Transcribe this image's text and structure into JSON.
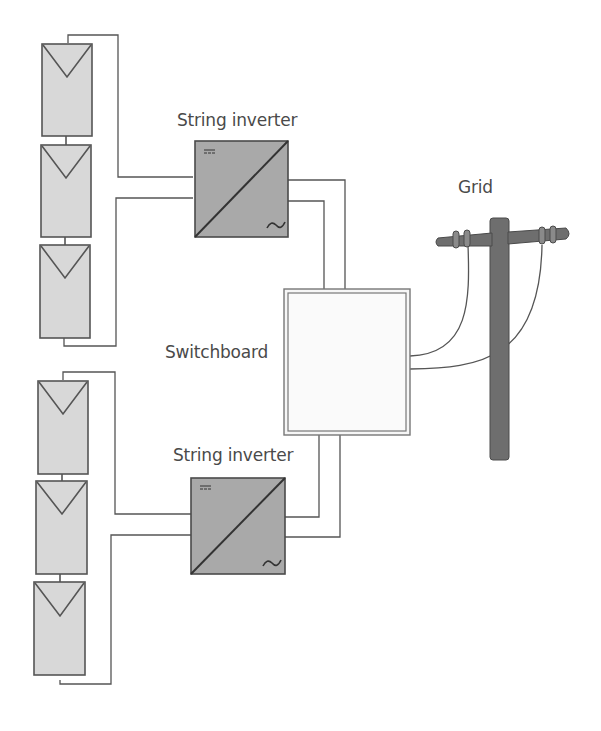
{
  "diagram": {
    "title": "",
    "labels": {
      "inverter_top": "String inverter",
      "inverter_bottom": "String inverter",
      "switchboard": "Switchboard",
      "grid": "Grid"
    },
    "colors": {
      "panel_fill": "#d8d8d8",
      "panel_stroke": "#555555",
      "inverter_fill": "#a9a9a9",
      "inverter_stroke": "#4a4a4a",
      "pole_fill": "#6e6e6e",
      "wire": "#555555",
      "switchboard_fill": "#f6f6f6",
      "text": "#4a4a4a"
    },
    "strings": [
      {
        "id": "string-top",
        "panels": 3
      },
      {
        "id": "string-bottom",
        "panels": 3
      }
    ],
    "inverter_symbols": {
      "dc": "=",
      "ac": "~"
    }
  }
}
